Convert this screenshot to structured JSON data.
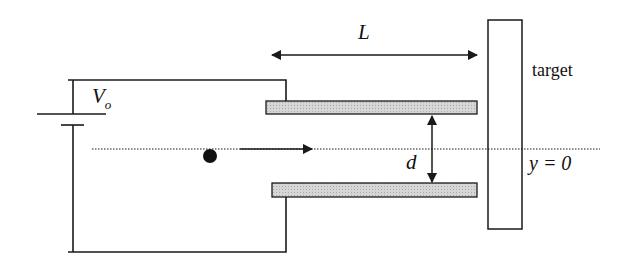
{
  "diagram": {
    "labels": {
      "length": "L",
      "voltage": "V",
      "voltage_sub": "o",
      "separation": "d",
      "target": "target",
      "axis": "y = 0"
    },
    "colors": {
      "line": "#1a1a1a",
      "plate_fill": "#cfcfcf",
      "particle": "#111111",
      "background": "#ffffff"
    },
    "components": [
      "battery",
      "top-plate",
      "bottom-plate",
      "particle",
      "velocity-arrow",
      "target",
      "length-arrow",
      "separation-arrow",
      "axis-line"
    ]
  }
}
